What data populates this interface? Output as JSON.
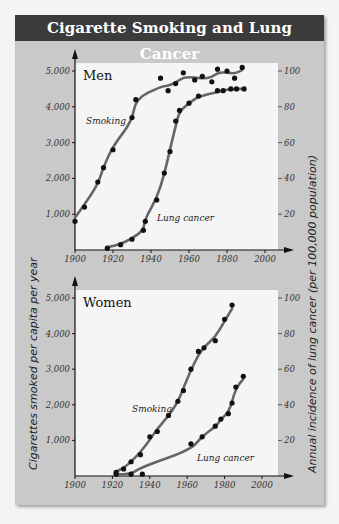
{
  "title": "Cigarette Smoking and Lung Cancer",
  "axes": {
    "left_title": "Cigarettes smoked per capita per year",
    "right_title": "Annual incidence of lung cancer (per 100,000 population)",
    "left_ticks": [
      "1,000",
      "2,000",
      "3,000",
      "4,000",
      "5,000"
    ],
    "right_ticks": [
      "20",
      "40",
      "60",
      "80",
      "100"
    ],
    "x_ticks": [
      "1900",
      "1920",
      "1940",
      "1960",
      "1980",
      "2000"
    ]
  },
  "panels": {
    "men": {
      "title": "Men",
      "smoking_label": "Smoking",
      "cancer_label": "Lung cancer"
    },
    "women": {
      "title": "Women",
      "smoking_label": "Smoking",
      "cancer_label": "Lung cancer"
    }
  },
  "colors": {
    "header_bg": "#3b3b3b",
    "panel_bg": "#c9c9c9",
    "plot_bg": "#f5f5f5",
    "curve": "#666666",
    "point": "#111111"
  },
  "chart_data": [
    {
      "type": "line",
      "title": "Men",
      "xlabel": "",
      "ylabel": "Cigarettes smoked per capita per year",
      "y2label": "Annual incidence of lung cancer (per 100,000 population)",
      "xlim": [
        1900,
        2010
      ],
      "ylim": [
        0,
        5000
      ],
      "y2lim": [
        0,
        100
      ],
      "x_ticks": [
        1900,
        1920,
        1940,
        1960,
        1980,
        2000
      ],
      "series": [
        {
          "name": "Smoking",
          "axis": "left",
          "points": [
            [
              1900,
              800
            ],
            [
              1905,
              1200
            ],
            [
              1912,
              1900
            ],
            [
              1915,
              2300
            ],
            [
              1920,
              2800
            ],
            [
              1930,
              3700
            ],
            [
              1932,
              4200
            ],
            [
              1945,
              4800
            ],
            [
              1949,
              4450
            ],
            [
              1953,
              4650
            ],
            [
              1957,
              4950
            ],
            [
              1963,
              4750
            ],
            [
              1967,
              4850
            ],
            [
              1972,
              4700
            ],
            [
              1975,
              5050
            ],
            [
              1980,
              5000
            ],
            [
              1984,
              4800
            ],
            [
              1988,
              5100
            ]
          ]
        },
        {
          "name": "Lung cancer",
          "axis": "right",
          "points": [
            [
              1917,
              1
            ],
            [
              1924,
              3
            ],
            [
              1930,
              6
            ],
            [
              1936,
              11
            ],
            [
              1937,
              16
            ],
            [
              1943,
              28
            ],
            [
              1947,
              43
            ],
            [
              1950,
              55
            ],
            [
              1953,
              72
            ],
            [
              1955,
              78
            ],
            [
              1960,
              82
            ],
            [
              1965,
              86
            ],
            [
              1975,
              89
            ],
            [
              1978,
              89
            ],
            [
              1982,
              90
            ],
            [
              1985,
              90
            ],
            [
              1989,
              90
            ]
          ]
        }
      ]
    },
    {
      "type": "line",
      "title": "Women",
      "xlabel": "",
      "ylabel": "Cigarettes smoked per capita per year",
      "y2label": "Annual incidence of lung cancer (per 100,000 population)",
      "xlim": [
        1900,
        2010
      ],
      "ylim": [
        0,
        5000
      ],
      "y2lim": [
        0,
        100
      ],
      "x_ticks": [
        1900,
        1920,
        1940,
        1960,
        1980,
        2000
      ],
      "series": [
        {
          "name": "Smoking",
          "axis": "left",
          "points": [
            [
              1922,
              100
            ],
            [
              1926,
              200
            ],
            [
              1930,
              400
            ],
            [
              1935,
              600
            ],
            [
              1940,
              1100
            ],
            [
              1944,
              1250
            ],
            [
              1950,
              1700
            ],
            [
              1955,
              2100
            ],
            [
              1958,
              2400
            ],
            [
              1962,
              3000
            ],
            [
              1966,
              3500
            ],
            [
              1969,
              3600
            ],
            [
              1975,
              3800
            ],
            [
              1980,
              4400
            ],
            [
              1984,
              4800
            ]
          ]
        },
        {
          "name": "Lung cancer",
          "axis": "right",
          "points": [
            [
              1922,
              1
            ],
            [
              1930,
              1
            ],
            [
              1936,
              1
            ],
            [
              1962,
              18
            ],
            [
              1968,
              22
            ],
            [
              1975,
              28
            ],
            [
              1978,
              32
            ],
            [
              1982,
              35
            ],
            [
              1984,
              41
            ],
            [
              1986,
              50
            ],
            [
              1990,
              56
            ]
          ]
        }
      ]
    }
  ]
}
